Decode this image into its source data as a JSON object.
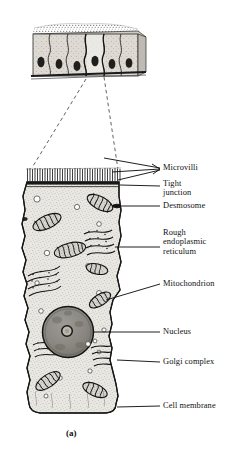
{
  "figure": {
    "caption": "(a)"
  },
  "inset": {
    "name": "simple-columnar-epithelium-tissue",
    "cell_count": 6,
    "has_brush_border": true,
    "has_basement_membrane": true
  },
  "labels": [
    {
      "id": "microvilli",
      "text": "Microvilli"
    },
    {
      "id": "tight-junction",
      "text": "Tight\njunction"
    },
    {
      "id": "desmosome",
      "text": "Desmosome"
    },
    {
      "id": "rough-er",
      "text": "Rough\nendoplasmic\nreticulum"
    },
    {
      "id": "mitochondrion",
      "text": "Mitochondrion"
    },
    {
      "id": "nucleus",
      "text": "Nucleus"
    },
    {
      "id": "golgi",
      "text": "Golgi complex"
    },
    {
      "id": "cell-membrane",
      "text": "Cell membrane"
    }
  ],
  "colors": {
    "ink": "#111111",
    "line": "#1a1a1a",
    "cytoplasm": "#e8e6e1",
    "cytoplasm_dark": "#d6d3cc",
    "nucleus": "#8d8b86",
    "nucleolus": "#b8b5ae",
    "organelle_fill": "#cbc8c1",
    "vesicle": "#fdfdfb",
    "inset_cell": "#ddd9d2",
    "background": "#ffffff"
  }
}
